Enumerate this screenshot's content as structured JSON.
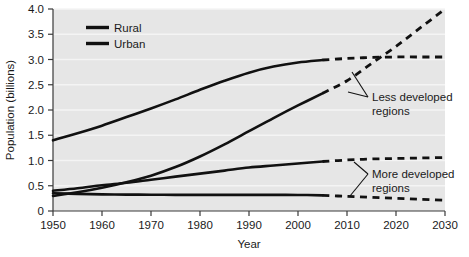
{
  "chart_data": {
    "type": "line",
    "title": "",
    "xlabel": "Year",
    "ylabel": "Population (billions)",
    "xlim": [
      1950,
      2030
    ],
    "ylim": [
      0,
      4.0
    ],
    "xticks": [
      "1950",
      "1960",
      "1970",
      "1980",
      "1990",
      "2000",
      "2010",
      "2020",
      "2030"
    ],
    "yticks": [
      "0",
      "0.5",
      "1.0",
      "1.5",
      "2.0",
      "2.5",
      "3.0",
      "3.5",
      "4.0"
    ],
    "grid": true,
    "grid_color": "#f2f2f2",
    "plot_background": "#e6e6e6",
    "line_color": "#111111",
    "projection_start_year": 2005,
    "projection_style": "dashed",
    "legend": {
      "position": "top-left-inside",
      "entries": [
        {
          "label": "Rural",
          "color": "#111111"
        },
        {
          "label": "Urban",
          "color": "#111111"
        }
      ]
    },
    "annotations": [
      {
        "id": "less-developed",
        "text_line1": "Less developed",
        "text_line2": "regions"
      },
      {
        "id": "more-developed",
        "text_line1": "More developed",
        "text_line2": "regions"
      }
    ],
    "x": [
      1950,
      1955,
      1960,
      1965,
      1970,
      1975,
      1980,
      1985,
      1990,
      1995,
      2000,
      2005,
      2010,
      2015,
      2020,
      2025,
      2030
    ],
    "series": [
      {
        "name": "Less developed regions - Rural",
        "region": "Less developed",
        "type": "Rural",
        "values": [
          1.4,
          1.54,
          1.69,
          1.86,
          2.03,
          2.21,
          2.4,
          2.58,
          2.74,
          2.86,
          2.94,
          2.99,
          3.02,
          3.04,
          3.05,
          3.05,
          3.05
        ]
      },
      {
        "name": "Less developed regions - Urban",
        "region": "Less developed",
        "type": "Urban",
        "values": [
          0.3,
          0.37,
          0.46,
          0.57,
          0.7,
          0.87,
          1.08,
          1.32,
          1.58,
          1.84,
          2.09,
          2.33,
          2.58,
          2.92,
          3.26,
          3.63,
          4.0
        ]
      },
      {
        "name": "More developed regions - Urban",
        "region": "More developed",
        "type": "Urban",
        "values": [
          0.4,
          0.45,
          0.51,
          0.56,
          0.62,
          0.68,
          0.74,
          0.8,
          0.86,
          0.9,
          0.94,
          0.98,
          1.01,
          1.03,
          1.04,
          1.05,
          1.06
        ]
      },
      {
        "name": "More developed regions - Rural",
        "region": "More developed",
        "type": "Rural",
        "values": [
          0.35,
          0.34,
          0.33,
          0.325,
          0.322,
          0.32,
          0.32,
          0.32,
          0.32,
          0.32,
          0.318,
          0.31,
          0.29,
          0.27,
          0.25,
          0.232,
          0.215
        ]
      }
    ]
  }
}
